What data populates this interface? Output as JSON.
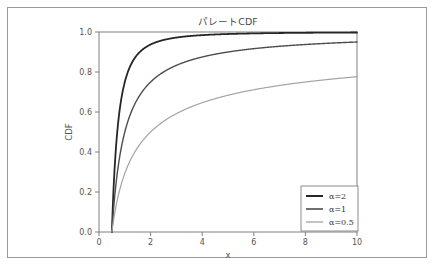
{
  "figure": {
    "title": "パレートCDF",
    "background_color": "#ffffff",
    "frame_color": "#9a9a9a"
  },
  "chart_data": {
    "type": "line",
    "title": "パレートCDF",
    "xlabel": "x",
    "ylabel": "CDF",
    "xlim": [
      0,
      10
    ],
    "ylim": [
      0.0,
      1.0
    ],
    "xticks": [
      "0",
      "2",
      "4",
      "6",
      "8",
      "10"
    ],
    "yticks": [
      "0.0",
      "0.2",
      "0.4",
      "0.6",
      "0.8",
      "1.0"
    ],
    "grid": false,
    "legend_position": "lower right",
    "x_min_support": 0.5,
    "series": [
      {
        "name": "α=2",
        "alpha": 2,
        "color": "#262626",
        "linewidth": 1.8,
        "x": [
          0.5,
          0.55,
          0.6,
          0.7,
          0.8,
          0.9,
          1.0,
          1.2,
          1.4,
          1.6,
          1.8,
          2.0,
          2.5,
          3.0,
          3.5,
          4.0,
          5.0,
          6.0,
          7.0,
          8.0,
          9.0,
          10.0
        ],
        "y": [
          0.0,
          0.174,
          0.306,
          0.49,
          0.609,
          0.691,
          0.75,
          0.826,
          0.872,
          0.902,
          0.923,
          0.938,
          0.96,
          0.972,
          0.98,
          0.984,
          0.99,
          0.993,
          0.995,
          0.996,
          0.997,
          0.998
        ]
      },
      {
        "name": "α=1",
        "alpha": 1,
        "color": "#4d4d4d",
        "linewidth": 1.4,
        "x": [
          0.5,
          0.55,
          0.6,
          0.7,
          0.8,
          0.9,
          1.0,
          1.2,
          1.4,
          1.6,
          1.8,
          2.0,
          2.5,
          3.0,
          3.5,
          4.0,
          5.0,
          6.0,
          7.0,
          8.0,
          9.0,
          10.0
        ],
        "y": [
          0.0,
          0.091,
          0.167,
          0.286,
          0.375,
          0.444,
          0.5,
          0.583,
          0.643,
          0.688,
          0.722,
          0.75,
          0.8,
          0.833,
          0.857,
          0.875,
          0.9,
          0.917,
          0.929,
          0.938,
          0.944,
          0.95
        ]
      },
      {
        "name": "α=0.5",
        "alpha": 0.5,
        "color": "#a3a3a3",
        "linewidth": 1.2,
        "x": [
          0.5,
          0.55,
          0.6,
          0.7,
          0.8,
          0.9,
          1.0,
          1.2,
          1.4,
          1.6,
          1.8,
          2.0,
          2.5,
          3.0,
          3.5,
          4.0,
          5.0,
          6.0,
          7.0,
          8.0,
          9.0,
          10.0
        ],
        "y": [
          0.0,
          0.0465,
          0.0871,
          0.155,
          0.2094,
          0.2546,
          0.2929,
          0.3545,
          0.4023,
          0.4408,
          0.4729,
          0.5,
          0.5528,
          0.5918,
          0.622,
          0.6464,
          0.6838,
          0.7113,
          0.7326,
          0.75,
          0.7643,
          0.7764
        ]
      }
    ]
  },
  "legend": {
    "entries": [
      {
        "label": "α=2",
        "color": "#262626"
      },
      {
        "label": "α=1",
        "color": "#4d4d4d"
      },
      {
        "label": "α=0.5",
        "color": "#a3a3a3"
      }
    ]
  }
}
